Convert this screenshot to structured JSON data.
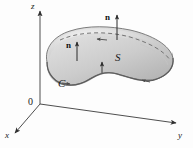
{
  "figure": {
    "caption_hidden": "Oriented surface S with unit normal vectors n and boundary curve C in xyz-space",
    "background": "#fdfdfd",
    "axes": {
      "origin_label": "0",
      "x_label": "x",
      "y_label": "y",
      "z_label": "z",
      "axis_color": "#3a3a3a"
    },
    "surface": {
      "label": "S",
      "fill_light": "#e9e9e9",
      "fill_mid": "#cfcfcf",
      "fill_dark": "#b4b4b4",
      "edge_color": "#6f6f6f"
    },
    "boundary": {
      "label": "C",
      "color": "#555555",
      "orientation": "counterclockwise"
    },
    "normals": [
      {
        "label": "n",
        "position": "left"
      },
      {
        "label": "n",
        "position": "top-right"
      },
      {
        "label": "",
        "position": "center-small"
      }
    ],
    "dashed_curve": {
      "style": "dashed",
      "color": "#6a6a6a",
      "arrow_direction": "left"
    }
  }
}
